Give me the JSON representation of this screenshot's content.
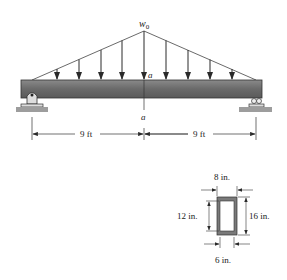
{
  "load": {
    "label": "w",
    "subscript": "0",
    "distribution": "triangular",
    "arrow_count": 9
  },
  "section_marker": {
    "top": "a",
    "bottom": "a"
  },
  "beam": {
    "span_left": "9 ft",
    "span_right": "9 ft",
    "left_support": "pin",
    "right_support": "roller"
  },
  "cross_section": {
    "shape": "hollow-rectangle",
    "outer_width": "8 in.",
    "inner_width": "6 in.",
    "inner_height": "12 in.",
    "outer_height": "16 in."
  },
  "colors": {
    "beam": "#6f6f6f",
    "beam_light": "#9a9a9a",
    "ground": "#9d9d9d",
    "line": "#2a2a2a"
  }
}
